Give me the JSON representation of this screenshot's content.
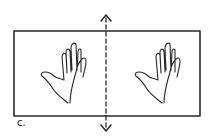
{
  "diagram": {
    "label": "c.",
    "elements": [
      {
        "type": "rectangle-frame"
      },
      {
        "type": "dashed-line",
        "orientation": "vertical",
        "arrows": "both-ends"
      },
      {
        "type": "hand",
        "side": "left",
        "orientation": "palm-outline"
      },
      {
        "type": "hand",
        "side": "right",
        "orientation": "palm-outline"
      }
    ],
    "colors": {
      "stroke": "#2a2a2a",
      "background": "#ffffff"
    }
  }
}
